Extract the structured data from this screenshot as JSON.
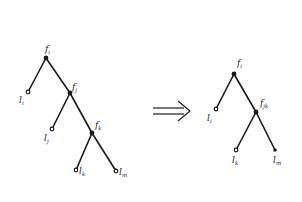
{
  "diagram": {
    "type": "tree-transformation",
    "colors": {
      "ink": "#1a1a1a",
      "background": "#ffffff"
    },
    "left_tree": {
      "nodes": [
        {
          "id": "fi",
          "kind": "internal",
          "label": "f",
          "sub": "i",
          "x": 46,
          "y": 58
        },
        {
          "id": "li",
          "kind": "leaf",
          "label": "l",
          "sub": "i",
          "x": 28,
          "y": 92
        },
        {
          "id": "fj",
          "kind": "internal",
          "label": "f",
          "sub": "j",
          "x": 70,
          "y": 93
        },
        {
          "id": "lj",
          "kind": "leaf",
          "label": "l",
          "sub": "j",
          "x": 52,
          "y": 129
        },
        {
          "id": "fk",
          "kind": "internal",
          "label": "f",
          "sub": "k",
          "x": 92,
          "y": 133
        },
        {
          "id": "lk",
          "kind": "leaf",
          "label": "l",
          "sub": "k",
          "x": 76,
          "y": 170
        },
        {
          "id": "lm",
          "kind": "leaf",
          "label": "l",
          "sub": "m",
          "x": 116,
          "y": 171
        }
      ],
      "edges": [
        [
          "fi",
          "li"
        ],
        [
          "fi",
          "fj"
        ],
        [
          "fj",
          "lj"
        ],
        [
          "fj",
          "fk"
        ],
        [
          "fk",
          "lk"
        ],
        [
          "fk",
          "lm"
        ]
      ]
    },
    "arrow": {
      "symbol": "⟹",
      "label": "implies"
    },
    "right_tree": {
      "nodes": [
        {
          "id": "fi",
          "kind": "internal",
          "label": "f",
          "sub": "i",
          "x": 234,
          "y": 74
        },
        {
          "id": "li",
          "kind": "leaf",
          "label": "l",
          "sub": "i",
          "x": 216,
          "y": 109
        },
        {
          "id": "fjk",
          "kind": "internal",
          "label": "f",
          "sub": "jk",
          "x": 256,
          "y": 112
        },
        {
          "id": "lk",
          "kind": "leaf",
          "label": "l",
          "sub": "k",
          "x": 236,
          "y": 150
        },
        {
          "id": "lm",
          "kind": "leaf",
          "label": "l",
          "sub": "m",
          "x": 275,
          "y": 150
        }
      ],
      "edges": [
        [
          "fi",
          "li"
        ],
        [
          "fi",
          "fjk"
        ],
        [
          "fjk",
          "lk"
        ],
        [
          "fjk",
          "lm"
        ]
      ]
    },
    "labels": {
      "left_fi": "f",
      "left_fi_sub": "i",
      "left_li": "l",
      "left_li_sub": "i",
      "left_fj": "f",
      "left_fj_sub": "j",
      "left_lj": "l",
      "left_lj_sub": "j",
      "left_fk": "f",
      "left_fk_sub": "k",
      "left_lk": "l",
      "left_lk_sub": "k",
      "left_lm": "l",
      "left_lm_sub": "m",
      "right_fi": "f",
      "right_fi_sub": "i",
      "right_li": "l",
      "right_li_sub": "i",
      "right_fjk": "f",
      "right_fjk_sub": "jk",
      "right_lk": "l",
      "right_lk_sub": "k",
      "right_lm": "l",
      "right_lm_sub": "m"
    }
  }
}
